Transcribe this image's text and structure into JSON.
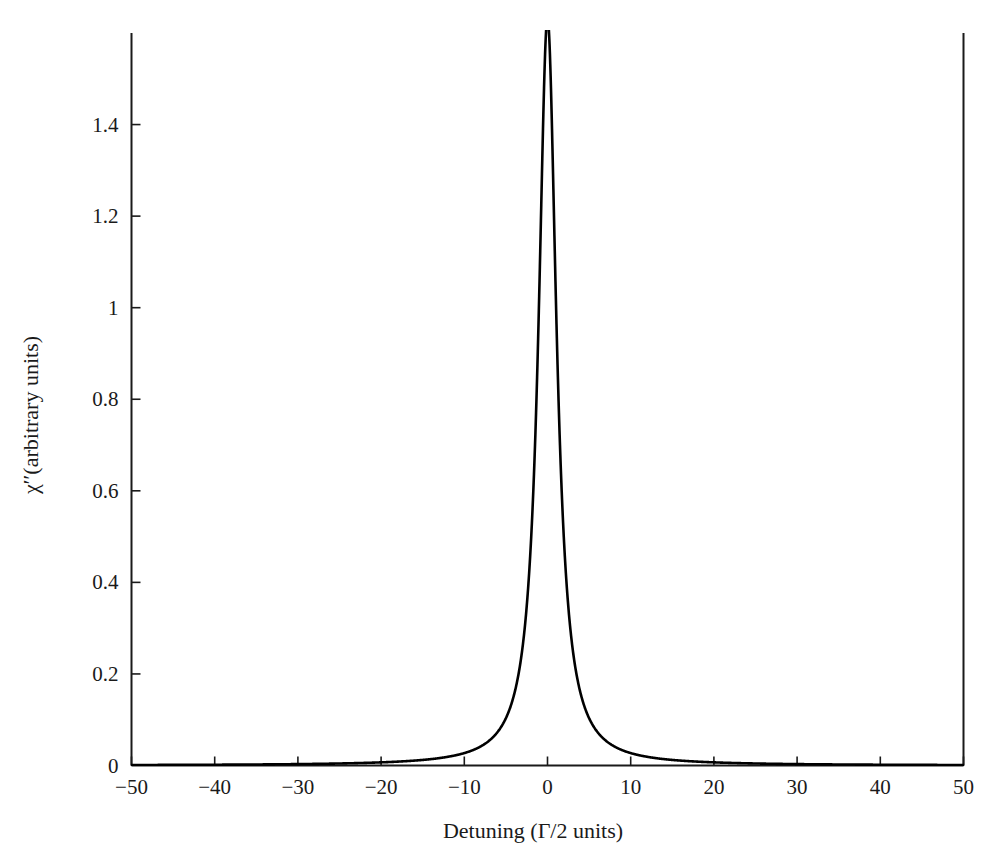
{
  "chart_data": {
    "type": "line",
    "title": "",
    "xlabel": "Detuning (Γ/2 units)",
    "ylabel": "χ′′(arbitrary units)",
    "ylabel_symbol": "χ′′",
    "ylabel_rest": "(arbitrary units)",
    "xlim": [
      -50,
      50
    ],
    "ylim": [
      0,
      1.6
    ],
    "grid": false,
    "legend": "none",
    "series_name": "Lorentzian absorption lineshape",
    "line_color": "#000000",
    "line_width": 2.6,
    "peak_center": 0,
    "peak_value": 1.6,
    "peak_clipped": true,
    "half_width_half_max": 1.3,
    "xticks": [
      -50,
      -40,
      -30,
      -20,
      -10,
      0,
      10,
      20,
      30,
      40,
      50
    ],
    "xticklabels": [
      "−50",
      "−40",
      "−30",
      "−20",
      "−10",
      "0",
      "10",
      "20",
      "30",
      "40",
      "50"
    ],
    "yticks": [
      0,
      0.2,
      0.4,
      0.6,
      0.8,
      1,
      1.2,
      1.4
    ],
    "yticklabels": [
      "0",
      "0.2",
      "0.4",
      "0.6",
      "0.8",
      "1",
      "1.2",
      "1.4"
    ],
    "x": [
      -50,
      -48,
      -46,
      -44,
      -42,
      -40,
      -38,
      -36,
      -34,
      -32,
      -30,
      -28,
      -26,
      -24,
      -22,
      -20,
      -18,
      -16,
      -14,
      -12,
      -11,
      -10,
      -9,
      -8,
      -7,
      -6,
      -5.5,
      -5,
      -4.5,
      -4,
      -3.5,
      -3,
      -2.75,
      -2.5,
      -2.25,
      -2,
      -1.8,
      -1.6,
      -1.4,
      -1.2,
      -1,
      -0.9,
      -0.8,
      -0.7,
      -0.6,
      -0.5,
      -0.4,
      -0.3,
      -0.2,
      -0.1,
      0,
      0.1,
      0.2,
      0.3,
      0.4,
      0.5,
      0.6,
      0.7,
      0.8,
      0.9,
      1,
      1.2,
      1.4,
      1.6,
      1.8,
      2,
      2.25,
      2.5,
      2.75,
      3,
      3.5,
      4,
      4.5,
      5,
      5.5,
      6,
      7,
      8,
      9,
      10,
      11,
      12,
      14,
      16,
      18,
      20,
      22,
      24,
      26,
      28,
      30,
      32,
      34,
      36,
      38,
      40,
      42,
      44,
      46,
      48,
      50
    ],
    "y": [
      0.0011,
      0.0012,
      0.0013,
      0.0014,
      0.0015,
      0.0017,
      0.0019,
      0.0021,
      0.0023,
      0.0026,
      0.003,
      0.0034,
      0.004,
      0.0047,
      0.0056,
      0.0068,
      0.0083,
      0.0106,
      0.0138,
      0.0187,
      0.0223,
      0.0268,
      0.0331,
      0.0418,
      0.0544,
      0.0737,
      0.0876,
      0.1056,
      0.1292,
      0.1612,
      0.2057,
      0.2693,
      0.3112,
      0.3627,
      0.4268,
      0.5064,
      0.5813,
      0.6698,
      0.7706,
      0.8785,
      0.9845,
      1.0331,
      1.0781,
      1.1186,
      1.1541,
      1.1842,
      1.2086,
      1.2274,
      1.2405,
      1.2484,
      1.251,
      1.2484,
      1.2405,
      1.2274,
      1.2086,
      1.1842,
      1.1541,
      1.1186,
      1.0781,
      1.0331,
      0.9845,
      0.8785,
      0.7706,
      0.6698,
      0.5813,
      0.5064,
      0.4268,
      0.3627,
      0.3112,
      0.2693,
      0.2057,
      0.1612,
      0.1292,
      0.1056,
      0.0876,
      0.0737,
      0.0544,
      0.0418,
      0.0331,
      0.0268,
      0.0223,
      0.0187,
      0.0138,
      0.0106,
      0.0083,
      0.0068,
      0.0056,
      0.0047,
      0.004,
      0.0034,
      0.003,
      0.0026,
      0.0023,
      0.0021,
      0.0019,
      0.0017,
      0.0015,
      0.0014,
      0.0013,
      0.0012,
      0.0011
    ]
  }
}
